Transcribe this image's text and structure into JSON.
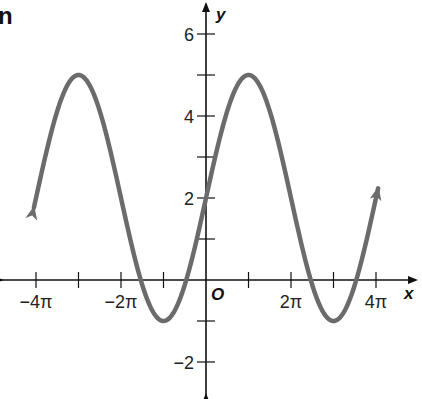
{
  "corner_label": "n",
  "chart_data": {
    "type": "line",
    "title": "",
    "function": "y = 2 + 3 sin(x/2)",
    "xlabel": "x",
    "ylabel": "y",
    "origin_label": "O",
    "xlim": [
      -4.5,
      4.4
    ],
    "xlim_units": "pi",
    "ylim": [
      -2.8,
      6.4
    ],
    "x_ticks": [
      -4,
      -3,
      -2,
      -1,
      1,
      2,
      3,
      4
    ],
    "x_tick_labels": [
      {
        "value": -4,
        "label": "−4π"
      },
      {
        "value": -2,
        "label": "−2π"
      },
      {
        "value": 2,
        "label": "2π"
      },
      {
        "value": 4,
        "label": "4π"
      }
    ],
    "y_ticks": [
      -2,
      -1,
      1,
      2,
      3,
      4,
      5,
      6
    ],
    "y_tick_labels": [
      {
        "value": -2,
        "label": "−2"
      },
      {
        "value": 2,
        "label": "2"
      },
      {
        "value": 4,
        "label": "4"
      },
      {
        "value": 6,
        "label": "6"
      }
    ],
    "series": [
      {
        "name": "curve",
        "x_range_pi": [
          -4.0,
          4.0
        ],
        "key_points": [
          {
            "x": "-3π",
            "y": 5
          },
          {
            "x": "-π",
            "y": -1
          },
          {
            "x": "0",
            "y": 2
          },
          {
            "x": "π",
            "y": 5
          },
          {
            "x": "3π",
            "y": -1
          }
        ],
        "color": "#6b6b6b"
      }
    ],
    "grid": false
  }
}
